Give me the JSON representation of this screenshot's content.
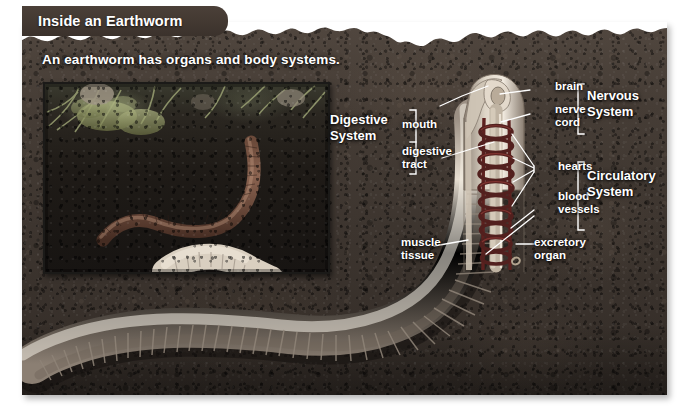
{
  "title": "Inside an Earthworm",
  "subtitle": "An earthworm has organs and body systems.",
  "photo": {
    "alt": "photograph-of-earthworm-in-soil"
  },
  "labels": {
    "brain": "brain",
    "nerve_cord": "nerve\ncord",
    "hearts": "hearts",
    "blood_vessels": "blood\nvessels",
    "mouth": "mouth",
    "digestive_tract": "digestive\ntract",
    "muscle_tissue": "muscle\ntissue",
    "excretory_organ": "excretory\norgan"
  },
  "systems": {
    "nervous": "Nervous\nSystem",
    "circulatory": "Circulatory\nSystem",
    "digestive": "Digestive\nSystem"
  },
  "colors": {
    "title_bar": "#3b322c",
    "soil_dark": "#332c27",
    "soil_light": "#51473f",
    "worm_body": "#d9cfc0",
    "worm_shadow": "#8d8174",
    "heart_red": "#6b2a26",
    "label_text": "#ffffff",
    "leader_line": "#ffffff",
    "photo_border": "#1b1a18"
  }
}
